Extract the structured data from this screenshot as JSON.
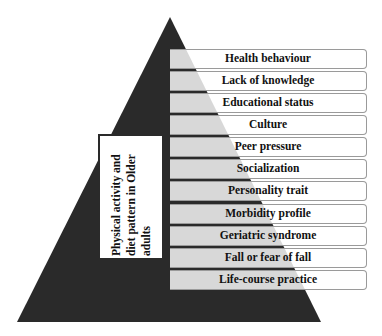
{
  "diagram": {
    "type": "pyramid",
    "colors": {
      "pyramid_fill": "#2a2a2a",
      "box_fill": "#ffffff",
      "box_border": "#9a9a9a",
      "text": "#111111"
    },
    "central_label": {
      "lines": [
        "Physical activity and",
        "diet pattern in Older",
        "adults"
      ]
    },
    "factors": [
      {
        "label": "Health behaviour"
      },
      {
        "label": "Lack of knowledge"
      },
      {
        "label": "Educational status"
      },
      {
        "label": "Culture"
      },
      {
        "label": "Peer pressure"
      },
      {
        "label": "Socialization"
      },
      {
        "label": "Personality trait"
      },
      {
        "label": "Morbidity profile"
      },
      {
        "label": "Geriatric syndrome"
      },
      {
        "label": "Fall or fear of fall"
      },
      {
        "label": "Life-course practice"
      }
    ]
  }
}
